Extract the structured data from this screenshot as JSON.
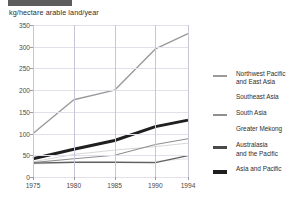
{
  "figure": {
    "axis_title": "kg/hectare arable land/year"
  },
  "chart_data": {
    "type": "line",
    "title": "",
    "xlabel": "",
    "ylabel": "kg/hectare arable land/year",
    "x": [
      1975,
      1980,
      1985,
      1990,
      1994
    ],
    "categories": [
      "1975",
      "1980",
      "1985",
      "1990",
      "1994"
    ],
    "xlim": [
      1975,
      1994
    ],
    "ylim": [
      0,
      350
    ],
    "yticks": [
      0,
      50,
      100,
      150,
      200,
      250,
      300,
      350
    ],
    "xticks": [
      1975,
      1980,
      1985,
      1990,
      1994
    ],
    "grid": true,
    "legend_position": "right",
    "series": [
      {
        "name": "Northwest Pacific and East Asia",
        "color": "#9a9a9a",
        "width": 1.4,
        "values": [
          100,
          178,
          200,
          295,
          330
        ]
      },
      {
        "name": "Southeast Asia",
        "color": "#d8d8d8",
        "width": 1.0,
        "values": [
          35,
          52,
          62,
          70,
          78
        ]
      },
      {
        "name": "South Asia",
        "color": "#8f8f8f",
        "width": 1.1,
        "values": [
          33,
          42,
          50,
          75,
          88
        ]
      },
      {
        "name": "Greater Mekong",
        "color": "#e4e4e4",
        "width": 1.0,
        "values": [
          30,
          33,
          33,
          36,
          42
        ]
      },
      {
        "name": "Australasia and the Pacific",
        "color": "#606060",
        "width": 1.3,
        "values": [
          32,
          34,
          34,
          33,
          49
        ]
      },
      {
        "name": "Asia and Pacific",
        "color": "#1f1f1f",
        "width": 3.0,
        "values": [
          42,
          64,
          84,
          116,
          131
        ]
      }
    ]
  },
  "legend": {
    "items": [
      {
        "label": "Northwest Pacific\nand East Asia",
        "color": "#9a9a9a",
        "thickness": 1.6,
        "visible": true
      },
      {
        "label": "Southeast Asia",
        "color": "#e8e8e8",
        "thickness": 1.2,
        "visible": false
      },
      {
        "label": "South Asia",
        "color": "#8f8f8f",
        "thickness": 1.6,
        "visible": true
      },
      {
        "label": "Greater Mekong",
        "color": "#f0f0f0",
        "thickness": 1.2,
        "visible": false
      },
      {
        "label": "Australasia\nand the Pacific",
        "color": "#4a4a4a",
        "thickness": 2.6,
        "visible": true
      },
      {
        "label": "Asia and Pacific",
        "color": "#1f1f1f",
        "thickness": 4.2,
        "visible": true
      }
    ]
  }
}
